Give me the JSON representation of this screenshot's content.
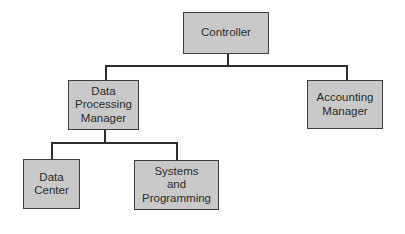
{
  "diagram": {
    "type": "org-chart",
    "colors": {
      "box_fill": "#c9c9c9",
      "box_border": "#3e3e3e",
      "connector": "#2e2e2e",
      "text": "#2a2a2a",
      "background": "#ffffff"
    },
    "nodes": {
      "controller": {
        "label": "Controller"
      },
      "dp_manager": {
        "label": "Data\nProcessing\nManager"
      },
      "accounting_manager": {
        "label": "Accounting\nManager"
      },
      "data_center": {
        "label": "Data\nCenter"
      },
      "systems_programming": {
        "label": "Systems\nand\nProgramming"
      }
    },
    "edges": [
      {
        "from": "Controller",
        "to": "Data Processing Manager"
      },
      {
        "from": "Controller",
        "to": "Accounting Manager"
      },
      {
        "from": "Data Processing Manager",
        "to": "Data Center"
      },
      {
        "from": "Data Processing Manager",
        "to": "Systems and Programming"
      }
    ]
  }
}
